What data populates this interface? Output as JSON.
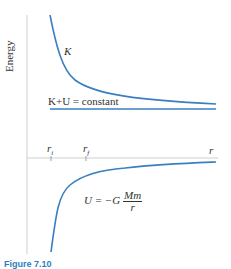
{
  "figure": {
    "y_axis_label": "Energy",
    "x_axis_label": "r",
    "ticks": [
      {
        "label": "r",
        "sub": "i"
      },
      {
        "label": "r",
        "sub": "f"
      }
    ],
    "curves": {
      "kinetic": {
        "label": "K"
      },
      "total": {
        "label": "K+U = constant"
      },
      "potential": {
        "label_prefix": "U = −G",
        "numerator": "Mm",
        "denominator": "r"
      }
    },
    "caption": "Figure 7.10",
    "colors": {
      "curve": "#3a7fc1",
      "axis": "#c8c8c8",
      "text": "#333333"
    }
  }
}
